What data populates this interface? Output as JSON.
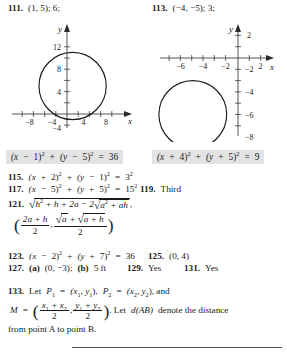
{
  "page": {
    "type": "textbook-answer-key",
    "highlight_color": "#e3e3e3",
    "text_color": "#1a1a1a"
  },
  "header": {
    "answer_111": {
      "number": "111.",
      "value": "(1, 5); 6;"
    },
    "answer_113": {
      "number": "113.",
      "value": "(−4, −5); 3;"
    }
  },
  "graphs": [
    {
      "id": "graph-111",
      "axis_labels": {
        "x": "x",
        "y": "y"
      },
      "x_ticks": [
        "−8",
        "−4",
        "4",
        "8"
      ],
      "y_ticks": [
        "12",
        "8",
        "4",
        "−4"
      ],
      "circle": {
        "center_x": 1,
        "center_y": 5,
        "radius": 6
      },
      "caption_equation": "(x − 1)² + (y − 5)² = 36"
    },
    {
      "id": "graph-113",
      "axis_labels": {
        "x": "x",
        "y": "y"
      },
      "x_ticks": [
        "−6",
        "−4",
        "−2",
        "2"
      ],
      "y_ticks": [
        "2",
        "−2",
        "−4",
        "−6",
        "−8"
      ],
      "circle": {
        "center_x": -4,
        "center_y": -5,
        "radius": 3
      },
      "caption_equation": "(x + 4)² + (y + 5)² = 9"
    }
  ],
  "equations": {
    "eq_111": {
      "lhs_a_open": "(x",
      "lhs_a_op": "−",
      "lhs_a_val": "1)",
      "exp": "2",
      "plus": "+",
      "lhs_b_open": "(y",
      "lhs_b_op": "−",
      "lhs_b_val": "5)",
      "eq": "=",
      "rhs": "36"
    },
    "eq_113": {
      "lhs_a_open": "(x",
      "lhs_a_op": "+",
      "lhs_a_val": "4)",
      "exp": "2",
      "plus": "+",
      "lhs_b_open": "(y",
      "lhs_b_op": "+",
      "lhs_b_val": "5)",
      "eq": "=",
      "rhs": "9"
    }
  },
  "answers": {
    "a115": {
      "number": "115.",
      "t1": "(x",
      "op1": "+",
      "t2": "2)",
      "e1": "2",
      "plus": "+",
      "t3": "(y",
      "op2": "−",
      "t4": "1)",
      "e2": "2",
      "eq": "=",
      "rbase": "3",
      "rexp": "2"
    },
    "a117": {
      "number": "117.",
      "t1": "(x",
      "op1": "−",
      "t2": "5)",
      "e1": "2",
      "plus": "+",
      "t3": "(y",
      "op2": "+",
      "t4": "5)",
      "e2": "2",
      "eq": "=",
      "rbase": "15",
      "rexp": "2"
    },
    "a119": {
      "number": "119.",
      "value": "Third"
    },
    "a121": {
      "number": "121.",
      "radicand_h": "h",
      "radicand_h_exp": "2",
      "radicand_mid": "+ h + 2a − 2",
      "inner_a": "a",
      "inner_a_exp": "2",
      "inner_tail": "+ ah",
      "comma": ",",
      "frac1_num": "2a + h",
      "frac1_den": "2",
      "frac2_num_r1": "a",
      "frac2_num_plus": "+",
      "frac2_num_r2": "a + h",
      "frac2_den": "2"
    },
    "a123": {
      "number": "123.",
      "t1": "(x",
      "op1": "−",
      "t2": "2)",
      "e1": "2",
      "plus": "+",
      "t3": "(y",
      "op2": "+",
      "t4": "7)",
      "e2": "2",
      "eq": "=",
      "rhs": "36"
    },
    "a125": {
      "number": "125.",
      "value": "(0, 4)"
    },
    "a127": {
      "number": "127.",
      "part_a_label": "(a)",
      "part_a_value": "(0, −3);",
      "part_b_label": "(b)",
      "part_b_value": "5 ft"
    },
    "a129": {
      "number": "129.",
      "value": "Yes"
    },
    "a131": {
      "number": "131.",
      "value": "Yes"
    },
    "a133": {
      "number": "133.",
      "let": "Let",
      "p1": "P",
      "p1_sub": "1",
      "eq1": "=",
      "p1_val_open": "(x",
      "p1_val_sub1": "1",
      "p1_val_comma": ", y",
      "p1_val_sub2": "1",
      "p1_val_close": "),",
      "p2": "P",
      "p2_sub": "2",
      "eq2": "=",
      "p2_val_open": "(x",
      "p2_val_sub1": "2",
      "p2_val_comma": ", y",
      "p2_val_sub2": "2",
      "p2_val_close": "), and",
      "m": "M",
      "m_eq": "=",
      "frac1_num_a": "x",
      "frac1_num_a_sub": "1",
      "frac1_num_plus": "+ x",
      "frac1_num_b_sub": "2",
      "frac1_den": "2",
      "frac2_num_a": "y",
      "frac2_num_a_sub": "1",
      "frac2_num_plus": "+ y",
      "frac2_num_b_sub": "2",
      "frac2_den": "2",
      "tail1": ". Let",
      "d_ab": "d(AB)",
      "tail2": "denote the distance",
      "tail3": "from point A to point B."
    }
  }
}
